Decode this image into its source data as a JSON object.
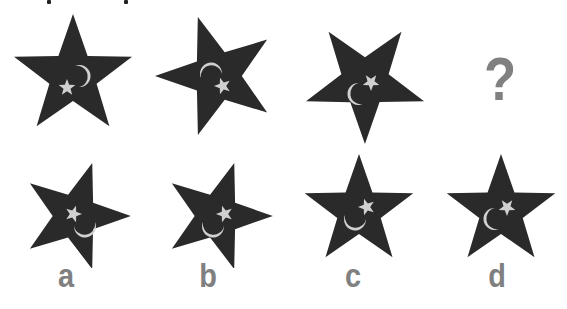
{
  "puzzle": {
    "colors": {
      "star_fill": "#2a2a2a",
      "symbol_fill": "#d0d0d0",
      "text_fill": "#808080"
    },
    "sequence": [
      {
        "id": "seq-1",
        "star_rotation": 0,
        "symbol_rotation": 0
      },
      {
        "id": "seq-2",
        "star_rotation": -18,
        "symbol_rotation": -90
      },
      {
        "id": "seq-3",
        "star_rotation": 36,
        "symbol_rotation": 180
      },
      {
        "id": "seq-4",
        "placeholder": "?"
      }
    ],
    "options": [
      {
        "label": "a",
        "star_rotation": 18,
        "symbol_rotation": 90
      },
      {
        "label": "b",
        "star_rotation": 18,
        "symbol_rotation": -90
      },
      {
        "label": "c",
        "star_rotation": 0,
        "symbol_rotation": 90
      },
      {
        "label": "d",
        "star_rotation": 0,
        "symbol_rotation": 180
      }
    ],
    "question_mark": "?"
  }
}
